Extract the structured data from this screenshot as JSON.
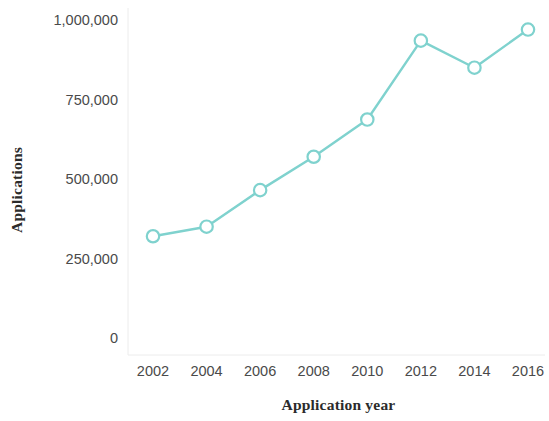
{
  "chart_data": {
    "type": "line",
    "title": "",
    "subtitle": "",
    "xlabel": "Application year",
    "ylabel": "Applications",
    "x": [
      2002,
      2004,
      2006,
      2008,
      2010,
      2012,
      2014,
      2016
    ],
    "categories": [
      "2002",
      "2004",
      "2006",
      "2008",
      "2010",
      "2012",
      "2014",
      "2016"
    ],
    "values": [
      320000,
      350000,
      465000,
      570000,
      687000,
      935000,
      850000,
      970000
    ],
    "series": [
      {
        "name": "Applications",
        "values": [
          320000,
          350000,
          465000,
          570000,
          687000,
          935000,
          850000,
          970000
        ],
        "color": "#7fd2ce",
        "marker": "open-circle"
      }
    ],
    "xlim": [
      2001,
      2017
    ],
    "ylim": [
      0,
      1050000
    ],
    "xticks": [
      2002,
      2004,
      2006,
      2008,
      2010,
      2012,
      2014,
      2016
    ],
    "xticklabels": [
      "2002",
      "2004",
      "2006",
      "2008",
      "2010",
      "2012",
      "2014",
      "2016"
    ],
    "yticks": [
      0,
      250000,
      500000,
      750000,
      1000000
    ],
    "yticklabels": [
      "0",
      "250,000",
      "500,000",
      "750,000",
      "1,000,000"
    ],
    "grid": false,
    "legend": "none",
    "background": "#ffffff",
    "axis_color": "#e8e8e8",
    "tick_label_color": "#4a4a4a",
    "axis_title_color": "#2b2b2b"
  }
}
